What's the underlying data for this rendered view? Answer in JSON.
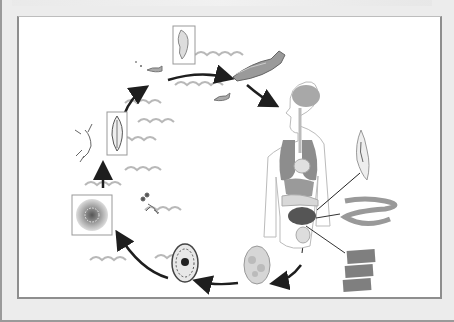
{
  "diagram": {
    "text_labels": [],
    "colors": {
      "frame_bg": "#ececec",
      "frame_border": "#8e8e8e",
      "panel_bg": "#ffffff",
      "arrow": "#1e1e1e",
      "organ_gray": "#8a8a8a",
      "wave": "#b8b8b8"
    },
    "stages": [
      {
        "id": "plerocercoid-larva",
        "icon": "larva-icon",
        "boxed": true
      },
      {
        "id": "fish-host",
        "icon": "fish-icon",
        "boxed": false
      },
      {
        "id": "human-host",
        "icon": "human-body-icon",
        "boxed": false
      },
      {
        "id": "scolex",
        "icon": "scolex-icon",
        "boxed": false
      },
      {
        "id": "adult-tapeworm",
        "icon": "tapeworm-icon",
        "boxed": false
      },
      {
        "id": "proglottids",
        "icon": "proglottid-icon",
        "boxed": false
      },
      {
        "id": "unembryonated-egg",
        "icon": "egg-icon",
        "boxed": false
      },
      {
        "id": "embryonated-egg",
        "icon": "embryonated-egg-icon",
        "boxed": false
      },
      {
        "id": "coracidium",
        "icon": "coracidium-icon",
        "boxed": true
      },
      {
        "id": "copepod",
        "icon": "copepod-icon",
        "boxed": false
      },
      {
        "id": "procercoid",
        "icon": "procercoid-icon",
        "boxed": true
      },
      {
        "id": "small-fish",
        "icon": "small-fish-icon",
        "boxed": false
      }
    ],
    "arrows": 7
  }
}
